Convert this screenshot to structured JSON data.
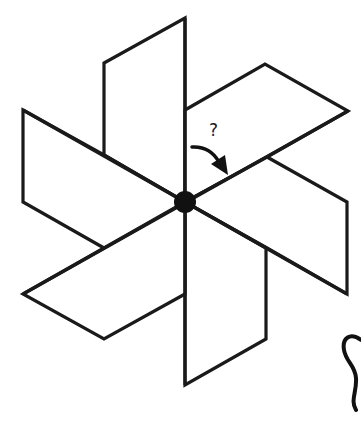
{
  "diagram": {
    "type": "rotational-symmetry-pinwheel",
    "blade_count": 6,
    "center": [
      185,
      202
    ],
    "question_label": "?",
    "colors": {
      "stroke": "#1a1a1a",
      "fill": "#ffffff",
      "hub": "#111111",
      "background": "#ffffff"
    },
    "blades": [
      {
        "name": "top",
        "points": "185,202 185,18 104,63 104,155"
      },
      {
        "name": "upper-right",
        "points": "185,110 265,64 348,111 267,157 185,202"
      },
      {
        "name": "lower-right",
        "points": "267,157 347,202 347,294 267,248 185,202"
      },
      {
        "name": "bottom",
        "points": "185,202 185,385 266,339 266,248"
      },
      {
        "name": "lower-left",
        "points": "185,294 104,339 23,294 104,248 185,202"
      },
      {
        "name": "upper-left",
        "points": "104,248 23,202 23,110 104,155 185,202"
      }
    ],
    "arrow": {
      "label": "rotation-arrow",
      "from": [
        192,
        147
      ],
      "to": [
        228,
        174
      ]
    }
  }
}
